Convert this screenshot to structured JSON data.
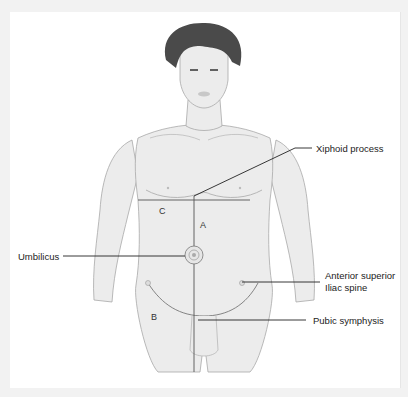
{
  "diagram": {
    "colors": {
      "skin": "#ececec",
      "outline": "#a8a8a8",
      "hair": "#4a4a4a",
      "leader": "#222222",
      "background": "#ffffff"
    },
    "labels": {
      "xiphoid": "Xiphoid process",
      "umbilicus": "Umbilicus",
      "asis_line1": "Anterior superior",
      "asis_line2": "Iliac spine",
      "pubic": "Pubic symphysis"
    },
    "regions": {
      "a": "A",
      "b": "B",
      "c": "C"
    }
  }
}
